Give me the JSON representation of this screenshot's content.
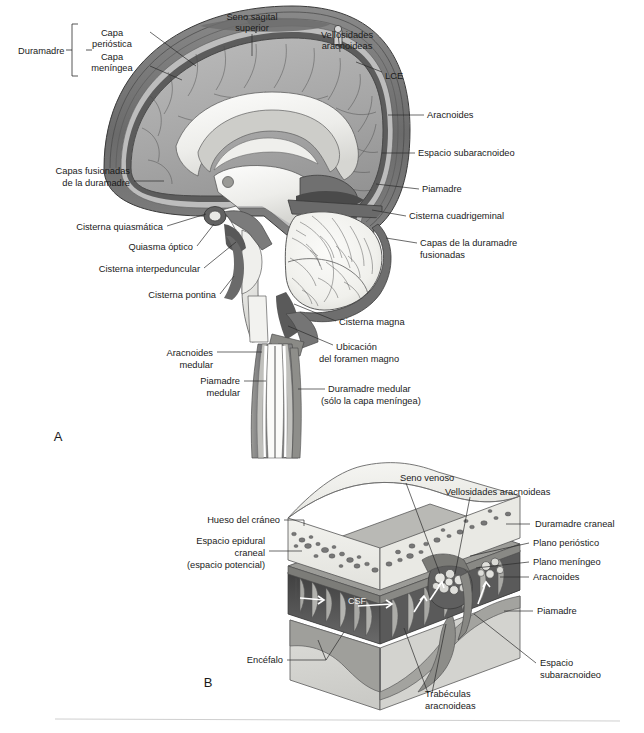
{
  "figure": {
    "type": "anatomical-diagram",
    "language": "es",
    "panels": [
      {
        "id": "A",
        "label": "A",
        "caption": "Corte sagital medio del encéfalo y la médula espinal mostrando las meninges y las cisternas subaracnoideas"
      },
      {
        "id": "B",
        "label": "B",
        "caption": "Bloque tridimensional del cráneo, las meninges craneales y la corteza cerebral"
      }
    ],
    "divider_color": "#cfcfcf"
  },
  "panel_a": {
    "label": "A",
    "labels": [
      {
        "id": "duramadre",
        "text": "Duramadre",
        "x": 18,
        "y": 50,
        "anchor": "start"
      },
      {
        "id": "capa-periostica-1",
        "text": "Capa",
        "x": 112,
        "y": 33,
        "anchor": "middle"
      },
      {
        "id": "capa-periostica-2",
        "text": "perióstica",
        "x": 112,
        "y": 44,
        "anchor": "middle"
      },
      {
        "id": "capa-meningea-1",
        "text": "Capa",
        "x": 112,
        "y": 57,
        "anchor": "middle"
      },
      {
        "id": "capa-meningea-2",
        "text": "meníngea",
        "x": 112,
        "y": 68,
        "anchor": "middle"
      },
      {
        "id": "seno-sagital-1",
        "text": "Seno sagital",
        "x": 252,
        "y": 17,
        "anchor": "middle"
      },
      {
        "id": "seno-sagital-2",
        "text": "superior",
        "x": 252,
        "y": 28,
        "anchor": "middle"
      },
      {
        "id": "vellosidades-1",
        "text": "Vellosidades",
        "x": 347,
        "y": 35,
        "anchor": "middle"
      },
      {
        "id": "vellosidades-2",
        "text": "aracnoideas",
        "x": 347,
        "y": 46,
        "anchor": "middle"
      },
      {
        "id": "lce",
        "text": "LCE",
        "x": 385,
        "y": 76,
        "anchor": "start"
      },
      {
        "id": "aracnoides",
        "text": "Aracnoides",
        "x": 427,
        "y": 118,
        "anchor": "start"
      },
      {
        "id": "espacio-subaracnoideo",
        "text": "Espacio subaracnoideo",
        "x": 418,
        "y": 156,
        "anchor": "start"
      },
      {
        "id": "piamadre",
        "text": "Piamadre",
        "x": 422,
        "y": 192,
        "anchor": "start"
      },
      {
        "id": "cisterna-cuadrigeminal",
        "text": "Cisterna cuadrigeminal",
        "x": 409,
        "y": 219,
        "anchor": "start"
      },
      {
        "id": "capas-duramadre-fus-1",
        "text": "Capas de la duramadre",
        "x": 420,
        "y": 246,
        "anchor": "start"
      },
      {
        "id": "capas-duramadre-fus-2",
        "text": "fusionadas",
        "x": 420,
        "y": 258,
        "anchor": "start"
      },
      {
        "id": "capas-fusionadas-1",
        "text": "Capas fusionadas",
        "x": 130,
        "y": 174,
        "anchor": "end"
      },
      {
        "id": "capas-fusionadas-2",
        "text": "de la duramadre",
        "x": 130,
        "y": 186,
        "anchor": "end"
      },
      {
        "id": "cisterna-quiasmatica",
        "text": "Cisterna quiasmática",
        "x": 163,
        "y": 230,
        "anchor": "end"
      },
      {
        "id": "quiasma-optico",
        "text": "Quiasma óptico",
        "x": 193,
        "y": 250,
        "anchor": "end"
      },
      {
        "id": "cisterna-interpeduncular",
        "text": "Cisterna interpeduncular",
        "x": 200,
        "y": 272,
        "anchor": "end"
      },
      {
        "id": "cisterna-pontina",
        "text": "Cisterna pontina",
        "x": 216,
        "y": 298,
        "anchor": "end"
      },
      {
        "id": "cisterna-magna",
        "text": "Cisterna magna",
        "x": 339,
        "y": 325,
        "anchor": "start"
      },
      {
        "id": "ubicacion-foramen-1",
        "text": "Ubicación",
        "x": 336,
        "y": 350,
        "anchor": "start"
      },
      {
        "id": "ubicacion-foramen-2",
        "text": "del foramen magno",
        "x": 319,
        "y": 362,
        "anchor": "start"
      },
      {
        "id": "aracnoides-medular-1",
        "text": "Aracnoides",
        "x": 213,
        "y": 356,
        "anchor": "end"
      },
      {
        "id": "aracnoides-medular-2",
        "text": "medular",
        "x": 213,
        "y": 368,
        "anchor": "end"
      },
      {
        "id": "piamadre-medular-1",
        "text": "Piamadre",
        "x": 240,
        "y": 384,
        "anchor": "end"
      },
      {
        "id": "piamadre-medular-2",
        "text": "medular",
        "x": 240,
        "y": 396,
        "anchor": "end"
      },
      {
        "id": "duramadre-medular-1",
        "text": "Duramadre medular",
        "x": 328,
        "y": 392,
        "anchor": "start"
      },
      {
        "id": "duramadre-medular-2",
        "text": "(sólo la capa meníngea)",
        "x": 321,
        "y": 404,
        "anchor": "start"
      }
    ]
  },
  "panel_b": {
    "label": "B",
    "labels": [
      {
        "id": "seno-venoso",
        "text": "Seno venoso",
        "x": 400,
        "y": 478,
        "anchor": "start"
      },
      {
        "id": "vellosidades-aracnoideas",
        "text": "Vellosidades aracnoideas",
        "x": 445,
        "y": 492,
        "anchor": "start"
      },
      {
        "id": "hueso-craneo",
        "text": "Hueso del cráneo",
        "x": 280,
        "y": 523,
        "anchor": "end"
      },
      {
        "id": "espacio-epidural-1",
        "text": "Espacio epidural",
        "x": 265,
        "y": 544,
        "anchor": "end"
      },
      {
        "id": "espacio-epidural-2",
        "text": "craneal",
        "x": 265,
        "y": 556,
        "anchor": "end"
      },
      {
        "id": "espacio-epidural-3",
        "text": "(espacio potencial)",
        "x": 265,
        "y": 568,
        "anchor": "end"
      },
      {
        "id": "duramadre-craneal",
        "text": "Duramadre craneal",
        "x": 535,
        "y": 527,
        "anchor": "start"
      },
      {
        "id": "plano-periostico",
        "text": "Plano perióstico",
        "x": 533,
        "y": 546,
        "anchor": "start"
      },
      {
        "id": "plano-meningeo",
        "text": "Plano meníngeo",
        "x": 533,
        "y": 565,
        "anchor": "start"
      },
      {
        "id": "aracnoides-b",
        "text": "Aracnoides",
        "x": 533,
        "y": 580,
        "anchor": "start"
      },
      {
        "id": "piamadre-b",
        "text": "Piamadre",
        "x": 537,
        "y": 614,
        "anchor": "start"
      },
      {
        "id": "espacio-subaracnoideo-b-1",
        "text": "Espacio",
        "x": 540,
        "y": 666,
        "anchor": "start"
      },
      {
        "id": "espacio-subaracnoideo-b-2",
        "text": "subaracnoideo",
        "x": 540,
        "y": 678,
        "anchor": "start"
      },
      {
        "id": "trabeculas-1",
        "text": "Trabéculas",
        "x": 425,
        "y": 697,
        "anchor": "start"
      },
      {
        "id": "trabeculas-2",
        "text": "aracnoideas",
        "x": 425,
        "y": 709,
        "anchor": "start"
      },
      {
        "id": "encefalo",
        "text": "Encéfalo",
        "x": 283,
        "y": 663,
        "anchor": "end"
      },
      {
        "id": "csf",
        "text": "CSF",
        "x": 348,
        "y": 604,
        "anchor": "start"
      }
    ]
  },
  "colors": {
    "bone_fill": "#efefeb",
    "dura_dark": "#6f6f6f",
    "dura_mid": "#8e8e8e",
    "arachnoid": "#b9b9b9",
    "cortex_gray": "#a9a9a9",
    "white_matter": "#f4f4f2",
    "csf_space": "#4f4f4f",
    "brain_light": "#d8d8d4",
    "text": "#1a1a1a",
    "leader": "#2b2b2b"
  }
}
